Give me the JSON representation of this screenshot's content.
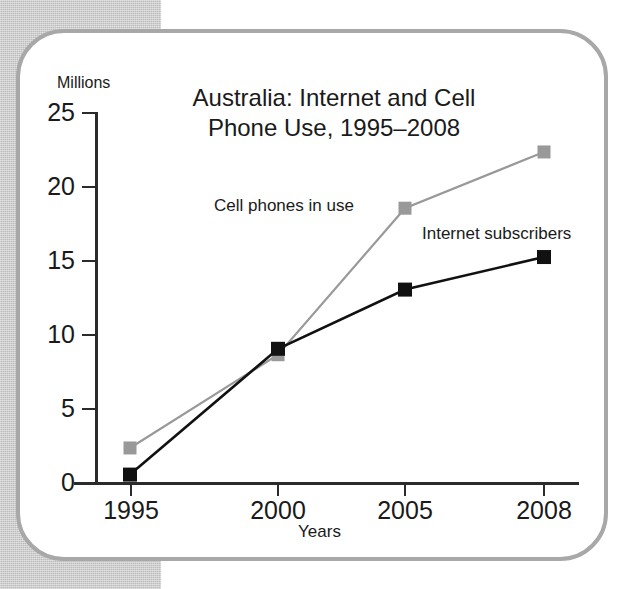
{
  "chart_data": {
    "type": "line",
    "title": "Australia: Internet and Cell Phone Use, 1995–2008",
    "title_line1": "Australia: Internet and Cell",
    "title_line2": "Phone Use, 1995–2008",
    "xlabel": "Years",
    "ylabel": "Millions",
    "unit_label": "Millions",
    "categories": [
      "1995",
      "2000",
      "2005",
      "2008"
    ],
    "x": [
      1995,
      2000,
      2005,
      2008
    ],
    "ylim": [
      0,
      25
    ],
    "yticks": [
      "0",
      "5",
      "10",
      "15",
      "20",
      "25"
    ],
    "ytick_values": [
      0,
      5,
      10,
      15,
      20,
      25
    ],
    "grid": false,
    "legend_position": "inline-annotations",
    "series": [
      {
        "name": "Cell phones in use",
        "color": "#999999",
        "marker": "square",
        "values": [
          2.3,
          8.6,
          18.5,
          22.3
        ]
      },
      {
        "name": "Internet subscribers",
        "color": "#111111",
        "marker": "square",
        "values": [
          0.5,
          9.0,
          13.0,
          15.2
        ]
      }
    ],
    "annotations": [
      {
        "text": "Cell phones in use",
        "series": "Cell phones in use"
      },
      {
        "text": "Internet subscribers",
        "series": "Internet subscribers"
      }
    ]
  },
  "colors": {
    "cell_phones": "#999999",
    "internet": "#111111",
    "axis": "#2b2b2b",
    "card_border": "#a8a8a8",
    "background_band": "#c9c9c9"
  }
}
